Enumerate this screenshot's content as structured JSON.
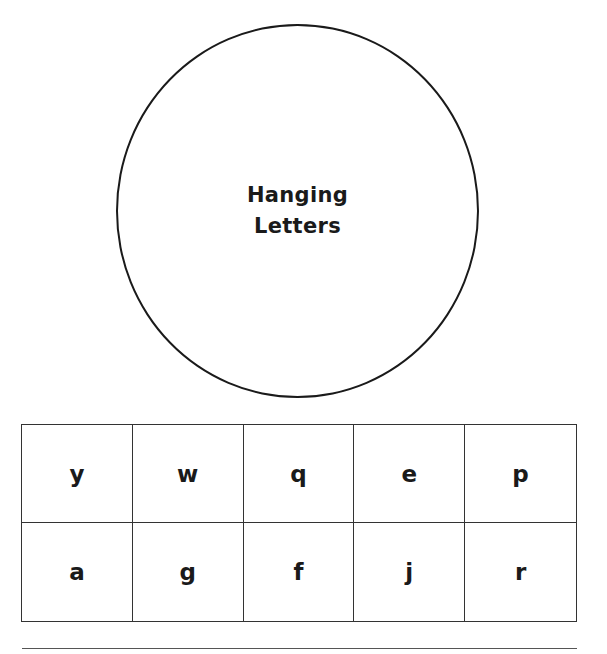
{
  "circle": {
    "title_line1": "Hanging",
    "title_line2": "Letters"
  },
  "letter_grid": {
    "rows": [
      [
        "y",
        "w",
        "q",
        "e",
        "p"
      ],
      [
        "a",
        "g",
        "f",
        "j",
        "r"
      ]
    ]
  }
}
